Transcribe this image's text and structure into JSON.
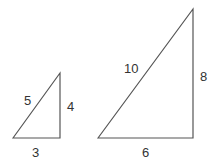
{
  "diagram": {
    "line_color": "#555555",
    "small_triangle": {
      "hypotenuse": "5",
      "vertical_leg": "4",
      "base": "3"
    },
    "large_triangle": {
      "hypotenuse": "10",
      "vertical_leg": "8",
      "base": "6"
    }
  }
}
